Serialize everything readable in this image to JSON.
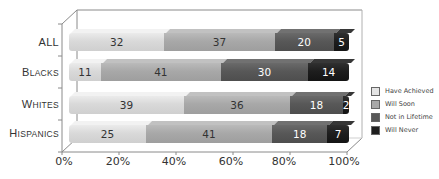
{
  "chart_data": {
    "type": "bar",
    "orientation": "horizontal",
    "stacked": true,
    "percent_stacked": true,
    "three_d": true,
    "title": "",
    "xlabel": "",
    "ylabel": "",
    "categories": [
      "ALL",
      "BLACKS",
      "WHITES",
      "HISPANICS"
    ],
    "series": [
      {
        "name": "Have Achieved",
        "color": "#d9d9d9",
        "values": [
          32,
          11,
          39,
          25
        ]
      },
      {
        "name": "Will Soon",
        "color": "#a8a8a8",
        "values": [
          37,
          41,
          36,
          41
        ]
      },
      {
        "name": "Not in Lifetime",
        "color": "#585858",
        "values": [
          20,
          30,
          18,
          18
        ]
      },
      {
        "name": "Will Never",
        "color": "#1e1e1e",
        "values": [
          5,
          14,
          2,
          7
        ]
      }
    ],
    "x_ticks": [
      "0%",
      "20%",
      "40%",
      "60%",
      "80%",
      "100%"
    ],
    "xlim": [
      0,
      100
    ],
    "grid": false,
    "legend_position": "right"
  },
  "categories_display": [
    {
      "first": "A",
      "rest": "LL"
    },
    {
      "first": "B",
      "rest": "LACKS"
    },
    {
      "first": "W",
      "rest": "HITES"
    },
    {
      "first": "H",
      "rest": "ISPANICS"
    }
  ],
  "legend": [
    {
      "label": "Have Achieved"
    },
    {
      "label": "Will Soon"
    },
    {
      "label": "Not in Lifetime"
    },
    {
      "label": "Will Never"
    }
  ]
}
